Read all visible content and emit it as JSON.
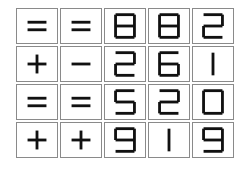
{
  "puzzle": {
    "rows": [
      {
        "op1": "=",
        "op2": "=",
        "digits": [
          "8",
          "8",
          "2"
        ]
      },
      {
        "op1": "+",
        "op2": "-",
        "digits": [
          "2",
          "6",
          "1"
        ]
      },
      {
        "op1": "=",
        "op2": "=",
        "digits": [
          "5",
          "2",
          "0"
        ]
      },
      {
        "op1": "+",
        "op2": "+",
        "digits": [
          "9",
          "1",
          "9"
        ]
      }
    ]
  },
  "colors": {
    "stroke": "#111111",
    "cell_border": "#8a8a8a",
    "background": "#ffffff"
  }
}
